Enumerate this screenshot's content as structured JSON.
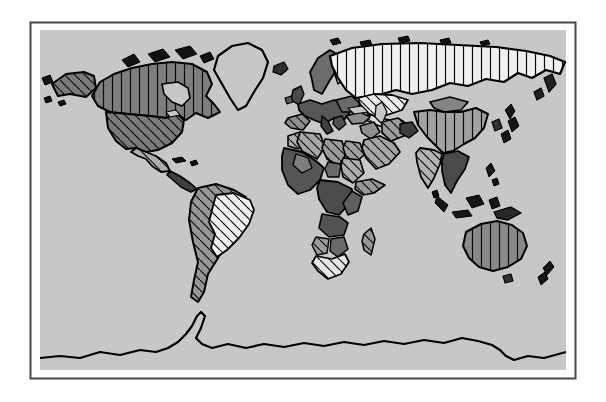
{
  "figure": {
    "kind": "world-map-hatched-figure"
  },
  "colors": {
    "page_background": "#ffffff",
    "frame_border": "#474747",
    "ocean": "#c7c7c7",
    "coastline": "#000000",
    "hatch_line": "#0a0a0a"
  },
  "patterns": {
    "vertical": {
      "spacing": 9,
      "stroke_width": 1.2
    },
    "diagonal": {
      "spacing": 10,
      "stroke_width": 1.2
    }
  },
  "regions": [
    {
      "name": "greenland",
      "fill": "#c7c7c7",
      "pattern": "none",
      "sw": 2.2,
      "points": "218,56 232,46 248,43 262,50 268,62 263,78 254,92 246,106 238,110 230,98 222,84 214,70"
    },
    {
      "name": "arctic-island-1",
      "fill": "#111111",
      "pattern": "none",
      "sw": 1,
      "points": "122,60 134,54 140,62 128,67"
    },
    {
      "name": "arctic-island-2",
      "fill": "#111111",
      "pattern": "none",
      "sw": 1,
      "points": "148,54 163,49 170,57 155,62"
    },
    {
      "name": "arctic-island-3",
      "fill": "#111111",
      "pattern": "none",
      "sw": 1,
      "points": "175,50 190,46 197,54 183,59"
    },
    {
      "name": "arctic-island-4",
      "fill": "#111111",
      "pattern": "none",
      "sw": 1,
      "points": "200,56 210,52 214,59 204,63"
    },
    {
      "name": "arctic-island-5",
      "fill": "#111111",
      "pattern": "none",
      "sw": 1,
      "points": "152,68 162,64 166,71 156,74"
    },
    {
      "name": "canada",
      "fill": "#7e7e7e",
      "pattern": "vertical",
      "sw": 2,
      "points": "92,96 100,82 114,74 132,68 152,64 172,62 192,64 207,72 212,84 206,96 214,104 220,112 208,118 196,113 186,120 176,113 166,118 150,116 128,114 110,112 98,106"
    },
    {
      "name": "hudson-bay",
      "fill": "#c7c7c7",
      "pattern": "none",
      "sw": 1.6,
      "points": "162,84 178,82 188,88 190,98 182,106 172,102 164,94"
    },
    {
      "name": "alaska",
      "fill": "#7b7b7b",
      "pattern": "diagonal",
      "sw": 2,
      "points": "52,84 66,74 84,72 94,76 96,88 86,97 70,94 58,96"
    },
    {
      "name": "bering-island-1",
      "fill": "#111111",
      "pattern": "none",
      "sw": 1,
      "points": "42,78 50,75 53,82 45,85"
    },
    {
      "name": "bering-island-2",
      "fill": "#111111",
      "pattern": "none",
      "sw": 1,
      "points": "44,98 50,96 52,101 46,103"
    },
    {
      "name": "bering-island-3",
      "fill": "#111111",
      "pattern": "none",
      "sw": 1,
      "points": "58,102 64,100 66,104 60,106"
    },
    {
      "name": "usa",
      "fill": "#7b7b7b",
      "pattern": "diagonal",
      "sw": 2,
      "points": "106,112 128,114 150,116 166,118 176,113 184,120 182,132 172,143 158,150 146,152 136,148 126,149 116,141 108,128"
    },
    {
      "name": "great-lakes",
      "fill": "#c7c7c7",
      "pattern": "none",
      "sw": 1.2,
      "points": "166,112 176,110 180,115 170,117"
    },
    {
      "name": "mexico",
      "fill": "#adadad",
      "pattern": "diagonal",
      "sw": 1.8,
      "points": "136,148 146,152 156,156 166,163 170,171 161,172 152,166 146,159 138,156 131,152"
    },
    {
      "name": "central-america",
      "fill": "#3f3f3f",
      "pattern": "none",
      "sw": 1.6,
      "points": "170,171 180,176 190,183 197,189 191,192 181,187 173,180 167,175"
    },
    {
      "name": "cuba",
      "fill": "#111111",
      "pattern": "none",
      "sw": 1,
      "points": "172,159 182,157 186,161 176,163"
    },
    {
      "name": "hispaniola",
      "fill": "#111111",
      "pattern": "none",
      "sw": 1,
      "points": "190,162 196,160 198,164 192,166"
    },
    {
      "name": "south-america-andes",
      "fill": "#979797",
      "pattern": "diagonal",
      "sw": 2,
      "points": "198,188 216,184 234,190 246,197 240,205 230,214 224,228 226,244 218,258 208,274 204,292 198,302 191,297 194,280 198,262 193,242 189,220 191,202"
    },
    {
      "name": "brazil",
      "fill": "#efefef",
      "pattern": "diagonal",
      "sw": 1.8,
      "points": "216,195 234,193 250,200 254,210 249,224 239,238 227,250 217,257 211,248 215,234 209,222 213,206"
    },
    {
      "name": "iceland",
      "fill": "#2e2e2e",
      "pattern": "none",
      "sw": 1.2,
      "points": "274,66 284,62 288,69 281,75 273,72"
    },
    {
      "name": "united-kingdom",
      "fill": "#4a4a4a",
      "pattern": "none",
      "sw": 1.4,
      "points": "293,90 301,86 304,94 299,105 291,100"
    },
    {
      "name": "ireland",
      "fill": "#565656",
      "pattern": "none",
      "sw": 1.2,
      "points": "285,98 291,96 293,102 287,104"
    },
    {
      "name": "scandinavia",
      "fill": "#6c6c6c",
      "pattern": "none",
      "sw": 1.8,
      "points": "310,72 318,58 330,50 340,56 338,68 330,80 322,94 314,90 312,80"
    },
    {
      "name": "finland",
      "fill": "#d2d2d2",
      "pattern": "none",
      "sw": 1.4,
      "points": "336,60 344,56 350,64 346,76 338,84 334,72"
    },
    {
      "name": "europe-mainland",
      "fill": "#575757",
      "pattern": "none",
      "sw": 1.8,
      "points": "298,104 310,100 322,104 334,100 344,104 350,112 344,120 334,118 324,124 314,120 305,116 299,110"
    },
    {
      "name": "spain",
      "fill": "#8f8f8f",
      "pattern": "diagonal",
      "sw": 1.6,
      "points": "288,118 302,114 310,121 303,130 291,128 285,123"
    },
    {
      "name": "italy",
      "fill": "#3f3f3f",
      "pattern": "none",
      "sw": 1.4,
      "points": "322,116 328,121 333,131 327,134 321,126"
    },
    {
      "name": "eastern-europe",
      "fill": "#6a6a6a",
      "pattern": "none",
      "sw": 1.6,
      "points": "336,100 352,96 360,104 354,112 342,112"
    },
    {
      "name": "balkans",
      "fill": "#4f4f4f",
      "pattern": "none",
      "sw": 1.4,
      "points": "334,118 342,116 346,124 339,130 333,124"
    },
    {
      "name": "russia",
      "fill": "#f0f0f0",
      "pattern": "vertical",
      "sw": 2.2,
      "points": "330,56 352,48 382,44 420,43 458,45 496,47 526,51 550,56 565,62 560,74 546,70 532,78 518,73 504,82 486,79 468,86 450,83 432,90 412,94 396,90 382,94 368,96 356,98 346,90 338,78 332,66"
    },
    {
      "name": "svalbard",
      "fill": "#111111",
      "pattern": "none",
      "sw": 1,
      "points": "330,40 338,38 341,43 333,45"
    },
    {
      "name": "arctic-russia-1",
      "fill": "#111111",
      "pattern": "none",
      "sw": 1,
      "points": "360,42 370,40 372,45 362,47"
    },
    {
      "name": "arctic-russia-2",
      "fill": "#111111",
      "pattern": "none",
      "sw": 1,
      "points": "398,38 408,36 410,41 400,43"
    },
    {
      "name": "arctic-russia-3",
      "fill": "#111111",
      "pattern": "none",
      "sw": 1,
      "points": "440,40 449,38 451,43 442,45"
    },
    {
      "name": "arctic-russia-4",
      "fill": "#111111",
      "pattern": "none",
      "sw": 1,
      "points": "480,42 488,40 490,44 482,46"
    },
    {
      "name": "kamchatka",
      "fill": "#222222",
      "pattern": "none",
      "sw": 1.2,
      "points": "544,78 552,74 556,84 549,92"
    },
    {
      "name": "okhotsk-coast",
      "fill": "#222222",
      "pattern": "none",
      "sw": 1.2,
      "points": "534,92 541,88 544,96 537,100"
    },
    {
      "name": "kazakhstan",
      "fill": "#ececec",
      "pattern": "diagonal",
      "sw": 1.8,
      "points": "358,98 374,94 392,95 408,100 402,110 390,114 378,118 366,112 360,104"
    },
    {
      "name": "central-asia",
      "fill": "#dedede",
      "pattern": "diagonal",
      "sw": 1.6,
      "points": "368,114 380,118 390,120 386,128 374,124 366,120"
    },
    {
      "name": "turkey",
      "fill": "#8a8a8a",
      "pattern": "none",
      "sw": 1.5,
      "points": "346,116 360,112 370,117 364,123 352,124"
    },
    {
      "name": "black-sea",
      "fill": "#c7c7c7",
      "pattern": "none",
      "sw": 1.2,
      "points": "348,108 362,106 368,112 354,114"
    },
    {
      "name": "caspian-sea",
      "fill": "#c7c7c7",
      "pattern": "none",
      "sw": 1.2,
      "points": "376,106 382,102 387,112 382,124 375,117"
    },
    {
      "name": "iraq-syria",
      "fill": "#8f8f8f",
      "pattern": "none",
      "sw": 1.5,
      "points": "360,126 374,122 380,132 371,139 362,133"
    },
    {
      "name": "iran",
      "fill": "#9e9e9e",
      "pattern": "diagonal",
      "sw": 1.6,
      "points": "382,122 398,118 410,126 404,136 391,141 382,133"
    },
    {
      "name": "afghanistan",
      "fill": "#3d3d3d",
      "pattern": "none",
      "sw": 1.4,
      "points": "400,124 412,122 418,131 409,138 400,133"
    },
    {
      "name": "saudi-arabia",
      "fill": "#a6a6a6",
      "pattern": "diagonal",
      "sw": 1.8,
      "points": "364,140 380,136 394,143 400,152 389,164 376,169 366,158 362,148"
    },
    {
      "name": "morocco",
      "fill": "#b0b0b0",
      "pattern": "diagonal",
      "sw": 1.6,
      "points": "288,136 300,132 306,141 298,149 288,146"
    },
    {
      "name": "algeria",
      "fill": "#a6a6a6",
      "pattern": "diagonal",
      "sw": 1.7,
      "points": "300,132 320,134 325,147 317,159 302,151 297,142"
    },
    {
      "name": "libya",
      "fill": "#9b9b9b",
      "pattern": "diagonal",
      "sw": 1.7,
      "points": "325,139 342,141 346,154 339,166 327,159 322,148"
    },
    {
      "name": "egypt",
      "fill": "#a0a0a0",
      "pattern": "diagonal",
      "sw": 1.6,
      "points": "346,141 360,143 364,155 355,163 346,156 343,148"
    },
    {
      "name": "west-africa",
      "fill": "#555555",
      "pattern": "none",
      "sw": 1.8,
      "points": "284,148 302,152 316,161 324,168 320,180 310,190 298,194 288,185 282,170 282,156"
    },
    {
      "name": "mali",
      "fill": "#7d7d7d",
      "pattern": "none",
      "sw": 1.3,
      "points": "296,154 308,158 312,168 302,173 293,165"
    },
    {
      "name": "chad",
      "fill": "#696969",
      "pattern": "none",
      "sw": 1.4,
      "points": "328,162 341,164 339,177 328,177 325,169"
    },
    {
      "name": "sudan",
      "fill": "#aeaeae",
      "pattern": "diagonal",
      "sw": 1.6,
      "points": "343,158 360,160 364,173 353,183 343,177 341,166"
    },
    {
      "name": "horn-of-africa",
      "fill": "#989898",
      "pattern": "diagonal",
      "sw": 1.6,
      "points": "356,182 372,179 385,185 374,193 363,195 355,189"
    },
    {
      "name": "congo-basin",
      "fill": "#4c4c4c",
      "pattern": "none",
      "sw": 1.8,
      "points": "320,180 338,182 352,189 350,203 339,215 327,212 319,199 317,188"
    },
    {
      "name": "east-africa",
      "fill": "#5e5e5e",
      "pattern": "none",
      "sw": 1.5,
      "points": "352,191 362,197 358,211 348,215 343,203"
    },
    {
      "name": "angola-zambia",
      "fill": "#535353",
      "pattern": "none",
      "sw": 1.6,
      "points": "322,214 340,217 348,223 344,235 329,237 319,228"
    },
    {
      "name": "namibia",
      "fill": "#9c9c9c",
      "pattern": "diagonal",
      "sw": 1.5,
      "points": "316,237 329,239 327,253 317,255 312,245"
    },
    {
      "name": "botswana-zimbabwe",
      "fill": "#696969",
      "pattern": "none",
      "sw": 1.4,
      "points": "331,239 344,237 348,249 338,257 330,251"
    },
    {
      "name": "south-africa",
      "fill": "#e6e6e6",
      "pattern": "diagonal",
      "sw": 1.7,
      "points": "316,256 332,259 345,254 349,262 341,274 328,279 318,271 312,263"
    },
    {
      "name": "madagascar",
      "fill": "#979797",
      "pattern": "diagonal",
      "sw": 1.5,
      "points": "364,234 371,228 375,239 371,255 364,250 362,241"
    },
    {
      "name": "india",
      "fill": "#b3b3b3",
      "pattern": "diagonal",
      "sw": 1.8,
      "points": "420,148 434,150 442,154 440,164 434,178 428,188 421,177 417,162 416,153"
    },
    {
      "name": "sri-lanka",
      "fill": "#111111",
      "pattern": "none",
      "sw": 1,
      "points": "432,192 437,190 439,196 434,198"
    },
    {
      "name": "mongolia",
      "fill": "#848484",
      "pattern": "none",
      "sw": 1.6,
      "points": "430,102 450,97 468,102 461,110 444,112 434,108"
    },
    {
      "name": "china",
      "fill": "#a2a2a2",
      "pattern": "vertical",
      "sw": 2,
      "points": "414,112 430,110 444,112 461,112 476,108 488,114 484,128 475,138 464,144 453,151 443,153 435,145 427,137 418,125"
    },
    {
      "name": "korea",
      "fill": "#333333",
      "pattern": "none",
      "sw": 1.2,
      "points": "492,122 499,119 502,128 495,131"
    },
    {
      "name": "japan-north",
      "fill": "#161616",
      "pattern": "none",
      "sw": 1,
      "points": "505,110 511,104 515,111 510,119"
    },
    {
      "name": "japan-main",
      "fill": "#161616",
      "pattern": "none",
      "sw": 1,
      "points": "508,121 515,117 519,126 512,132"
    },
    {
      "name": "japan-south",
      "fill": "#161616",
      "pattern": "none",
      "sw": 1,
      "points": "501,134 508,130 511,139 504,143"
    },
    {
      "name": "southeast-asia",
      "fill": "#4a4a4a",
      "pattern": "none",
      "sw": 1.7,
      "points": "444,154 458,151 469,157 465,169 457,181 451,193 445,185 442,171 442,161"
    },
    {
      "name": "sumatra",
      "fill": "#161616",
      "pattern": "none",
      "sw": 1,
      "points": "437,196 448,205 444,212 435,203"
    },
    {
      "name": "java",
      "fill": "#161616",
      "pattern": "none",
      "sw": 1,
      "points": "452,212 468,210 472,216 456,218"
    },
    {
      "name": "borneo",
      "fill": "#161616",
      "pattern": "none",
      "sw": 1,
      "points": "466,198 479,195 484,204 472,208"
    },
    {
      "name": "sulawesi",
      "fill": "#161616",
      "pattern": "none",
      "sw": 1,
      "points": "489,200 497,197 500,206 492,209"
    },
    {
      "name": "philippines-north",
      "fill": "#161616",
      "pattern": "none",
      "sw": 1,
      "points": "486,168 491,163 495,171 489,177"
    },
    {
      "name": "philippines-south",
      "fill": "#161616",
      "pattern": "none",
      "sw": 1,
      "points": "492,180 497,178 499,184 494,186"
    },
    {
      "name": "new-guinea",
      "fill": "#282828",
      "pattern": "none",
      "sw": 1.3,
      "points": "494,212 511,207 521,213 508,220 497,218"
    },
    {
      "name": "australia",
      "fill": "#898989",
      "pattern": "vertical",
      "sw": 2,
      "points": "466,232 481,224 497,221 512,225 523,233 527,246 521,259 508,267 493,271 479,267 469,258 463,246"
    },
    {
      "name": "tasmania",
      "fill": "#333333",
      "pattern": "none",
      "sw": 1.1,
      "points": "503,276 511,274 513,281 505,283"
    },
    {
      "name": "new-zealand-north",
      "fill": "#161616",
      "pattern": "none",
      "sw": 1,
      "points": "543,268 550,261 554,267 547,275"
    },
    {
      "name": "new-zealand-south",
      "fill": "#161616",
      "pattern": "none",
      "sw": 1,
      "points": "538,277 545,272 548,279 541,285"
    }
  ],
  "coastlines": [
    {
      "name": "antarctica-coast",
      "sw": 2.2,
      "points": "40,358 60,356 80,358 100,352 120,355 140,350 156,352 168,348 178,342 186,334 192,326 197,316 201,312 205,316 201,328 196,338 202,344 212,348 228,344 246,348 264,344 284,347 304,343 324,346 344,342 364,345 384,341 404,344 424,340 444,343 462,338 478,341 492,345 500,350 506,356 514,360 528,356 544,358 566,352"
    }
  ]
}
